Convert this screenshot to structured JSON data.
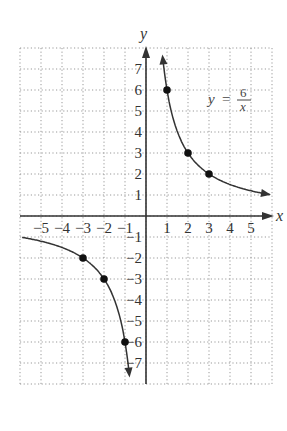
{
  "chart_data": {
    "type": "line",
    "title": "",
    "equation": {
      "lhs": "y",
      "eq": "=",
      "numerator": "6",
      "denominator": "x"
    },
    "xlabel": "x",
    "ylabel": "y",
    "xlim": [
      -6,
      6
    ],
    "ylim": [
      -8,
      8
    ],
    "grid": true,
    "grid_style": "dotted",
    "x_ticks": [
      -5,
      -4,
      -3,
      -2,
      -1,
      1,
      2,
      3,
      4,
      5
    ],
    "x_tick_labels": [
      "−5",
      "−4",
      "−3",
      "−2",
      "−1",
      "1",
      "2",
      "3",
      "4",
      "5"
    ],
    "y_ticks": [
      7,
      6,
      5,
      4,
      3,
      2,
      1,
      -1,
      -2,
      -3,
      -4,
      -5,
      -6,
      -7
    ],
    "y_tick_labels": [
      "7",
      "6",
      "5",
      "4",
      "3",
      "2",
      "1",
      "−1",
      "−2",
      "−3",
      "−4",
      "−5",
      "−6",
      "−7"
    ],
    "series": [
      {
        "name": "y = 6/x (x > 0)",
        "function": "6/x",
        "domain": [
          0.8,
          5.9
        ],
        "points": [
          {
            "x": 1,
            "y": 6
          },
          {
            "x": 2,
            "y": 3
          },
          {
            "x": 3,
            "y": 2
          }
        ]
      },
      {
        "name": "y = 6/x (x < 0)",
        "function": "6/x",
        "domain": [
          -5.9,
          -0.8
        ],
        "points": [
          {
            "x": -3,
            "y": -2
          },
          {
            "x": -2,
            "y": -3
          },
          {
            "x": -1,
            "y": -6
          }
        ]
      }
    ]
  },
  "labels": {
    "x_axis": "x",
    "y_axis": "y",
    "eq_lhs": "y",
    "eq_sign": "=",
    "eq_num": "6",
    "eq_den": "x"
  }
}
